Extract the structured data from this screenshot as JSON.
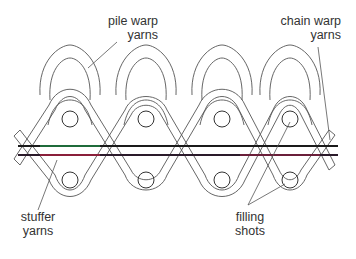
{
  "diagram": {
    "type": "woven carpet cross-section",
    "labels": {
      "pile_warp": [
        "pile warp",
        "yarns"
      ],
      "chain_warp": [
        "chain warp",
        "yarns"
      ],
      "stuffer": [
        "stuffer",
        "yarns"
      ],
      "filling": [
        "filling",
        "shots"
      ]
    },
    "colors": {
      "outline": "#555555",
      "stuffer_top": "#1a1a1a",
      "stuffer_top_accent": "#1f6b3a",
      "stuffer_bottom": "#2a1a2a",
      "stuffer_bottom_accent": "#8a1f3a"
    }
  }
}
